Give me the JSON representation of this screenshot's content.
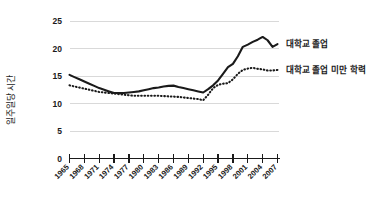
{
  "chart_data": {
    "type": "line",
    "title": "",
    "xlabel": "",
    "ylabel": "일주일당 시간",
    "ylim": [
      0,
      25
    ],
    "yticks": [
      0,
      5,
      10,
      15,
      20,
      25
    ],
    "ytick_labels": [
      "0",
      "5",
      "10",
      "15",
      "20",
      "25"
    ],
    "grid": "horizontal",
    "legend_position": "right",
    "categories": [
      "1965",
      "1966",
      "1967",
      "1968",
      "1969",
      "1970",
      "1971",
      "1972",
      "1973",
      "1974",
      "1975",
      "1976",
      "1977",
      "1978",
      "1979",
      "1980",
      "1981",
      "1982",
      "1983",
      "1984",
      "1985",
      "1986",
      "1987",
      "1988",
      "1989",
      "1990",
      "1991",
      "1992",
      "1993",
      "1994",
      "1995",
      "1996",
      "1997",
      "1998",
      "1999",
      "2000",
      "2001",
      "2002",
      "2003",
      "2004",
      "2005",
      "2006",
      "2007"
    ],
    "xtick_labels": [
      "1965",
      "1968",
      "1971",
      "1974",
      "1977",
      "1980",
      "1983",
      "1986",
      "1989",
      "1992",
      "1995",
      "1998",
      "2001",
      "2004",
      "2007"
    ],
    "series": [
      {
        "name": "대학교 졸업",
        "style": "solid",
        "color": "#1a1a1a",
        "values": [
          15.2,
          14.8,
          14.4,
          14.0,
          13.6,
          13.2,
          12.8,
          12.5,
          12.2,
          11.9,
          11.9,
          11.9,
          12.0,
          12.1,
          12.2,
          12.4,
          12.6,
          12.8,
          12.9,
          13.1,
          13.2,
          13.25,
          13.0,
          12.8,
          12.6,
          12.4,
          12.2,
          12.0,
          12.6,
          13.3,
          14.2,
          15.4,
          16.6,
          17.2,
          18.6,
          20.3,
          20.7,
          21.2,
          21.6,
          22.1,
          21.5,
          20.3,
          20.8
        ]
      },
      {
        "name": "대학교 졸업 미만 학력",
        "style": "dotted",
        "color": "#1a1a1a",
        "values": [
          13.3,
          13.1,
          12.9,
          12.7,
          12.5,
          12.3,
          12.1,
          12.0,
          11.9,
          11.8,
          11.7,
          11.6,
          11.5,
          11.4,
          11.4,
          11.4,
          11.4,
          11.4,
          11.4,
          11.35,
          11.3,
          11.25,
          11.2,
          11.1,
          11.0,
          10.9,
          10.8,
          10.6,
          11.6,
          12.8,
          13.4,
          13.6,
          13.7,
          14.4,
          15.4,
          16.1,
          16.35,
          16.5,
          16.3,
          16.2,
          16.0,
          16.0,
          16.1
        ]
      }
    ]
  },
  "legend": {
    "items": [
      {
        "label": "대학교 졸업",
        "style": "solid"
      },
      {
        "label": "대학교 졸업 미만 학력",
        "style": "dotted"
      }
    ]
  },
  "colors": {
    "background": "#ffffff",
    "ink": "#1a1a1a",
    "grid": "#d9d9d9"
  }
}
